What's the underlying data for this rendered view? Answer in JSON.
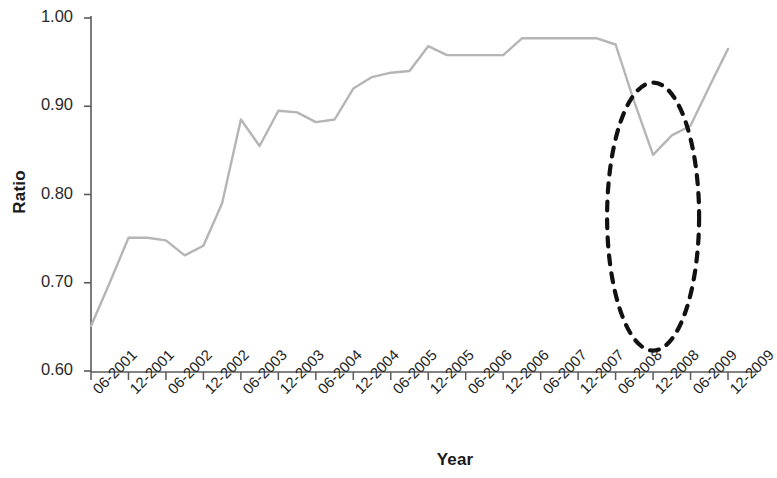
{
  "chart_data": {
    "type": "line",
    "title": "",
    "xlabel": "Year",
    "ylabel": "Ratio",
    "ylim": [
      0.6,
      1.0
    ],
    "yticks": [
      0.6,
      0.7,
      0.8,
      0.9,
      1.0
    ],
    "ytick_labels": [
      "0.60",
      "0.70",
      "0.80",
      "0.90",
      "1.00"
    ],
    "grid": false,
    "legend": null,
    "xtick_labels": [
      "06-2001",
      "12-2001",
      "06-2002",
      "12-2002",
      "06-2003",
      "12-2003",
      "06-2004",
      "12-2004",
      "06-2005",
      "12-2005",
      "06-2006",
      "12-2006",
      "06-2007",
      "12-2007",
      "06-2008",
      "12-2008",
      "06-2009",
      "12-2009"
    ],
    "x": [
      "06-2001",
      "09-2001",
      "12-2001",
      "03-2002",
      "06-2002",
      "09-2002",
      "12-2002",
      "03-2003",
      "06-2003",
      "09-2003",
      "12-2003",
      "03-2004",
      "06-2004",
      "09-2004",
      "12-2004",
      "03-2005",
      "06-2005",
      "09-2005",
      "12-2005",
      "03-2006",
      "06-2006",
      "09-2006",
      "12-2006",
      "03-2007",
      "06-2007",
      "09-2007",
      "12-2007",
      "03-2008",
      "06-2008",
      "09-2008",
      "12-2008",
      "03-2009",
      "06-2009",
      "09-2009",
      "12-2009"
    ],
    "values": [
      0.651,
      0.7,
      0.751,
      0.751,
      0.748,
      0.731,
      0.742,
      0.79,
      0.885,
      0.855,
      0.895,
      0.893,
      0.882,
      0.885,
      0.92,
      0.933,
      0.938,
      0.94,
      0.968,
      0.958,
      0.958,
      0.958,
      0.958,
      0.977,
      0.977,
      0.977,
      0.977,
      0.977,
      0.97,
      0.905,
      0.845,
      0.867,
      0.878,
      0.922,
      0.965
    ],
    "series": [
      {
        "name": "Ratio",
        "color": "#b5b5b5",
        "values": [
          0.651,
          0.7,
          0.751,
          0.751,
          0.748,
          0.731,
          0.742,
          0.79,
          0.885,
          0.855,
          0.895,
          0.893,
          0.882,
          0.885,
          0.92,
          0.933,
          0.938,
          0.94,
          0.968,
          0.958,
          0.958,
          0.958,
          0.958,
          0.977,
          0.977,
          0.977,
          0.977,
          0.977,
          0.97,
          0.905,
          0.845,
          0.867,
          0.878,
          0.922,
          0.965
        ]
      }
    ],
    "annotations": [
      {
        "type": "ellipse",
        "name": "highlight-ellipse",
        "style": "dashed",
        "color": "#111111",
        "x_center": "12-2008",
        "y_center": 0.775,
        "covers_range": [
          "06-2008",
          "09-2009"
        ]
      }
    ]
  },
  "axes": {
    "y_axis_color": "#5a5a5a",
    "x_axis_color": "#5a5a5a",
    "line_color": "#b5b5b5",
    "annotation_color": "#111111"
  }
}
